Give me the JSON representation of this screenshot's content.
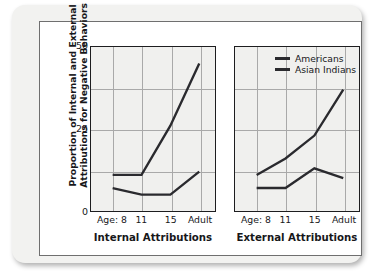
{
  "figure": {
    "y_axis_title": "Proportion of Internal and External\nAttributions for Negative Behaviors"
  },
  "chart_data": [
    {
      "type": "line",
      "title": "Internal Attributions",
      "xlabel": "",
      "ylabel": "Proportion of Internal and External Attributions for Negative Behaviors",
      "categories": [
        "Age: 8",
        "11",
        "15",
        "Adult"
      ],
      "ylim": [
        0,
        50
      ],
      "yticks": [
        0,
        25,
        50
      ],
      "ytick_labels": [
        "0",
        "25",
        "50"
      ],
      "grid": "both",
      "legend": "none",
      "series": [
        {
          "name": "Americans",
          "values": [
            11,
            11,
            26,
            45
          ]
        },
        {
          "name": "Asian Indians",
          "values": [
            7,
            5,
            5,
            12
          ]
        }
      ]
    },
    {
      "type": "line",
      "title": "External Attributions",
      "xlabel": "",
      "ylabel": "",
      "categories": [
        "Age: 8",
        "11",
        "15",
        "Adult"
      ],
      "ylim": [
        0,
        50
      ],
      "yticks": [
        0,
        25,
        50
      ],
      "ytick_labels": [],
      "grid": "both",
      "legend": "top-right-inside",
      "series": [
        {
          "name": "Americans",
          "values": [
            11,
            16,
            23,
            37
          ]
        },
        {
          "name": "Asian Indians",
          "values": [
            7,
            7,
            13,
            10
          ]
        }
      ]
    }
  ],
  "legend": {
    "entries": [
      {
        "label": "Americans",
        "color": "#2a2a2e"
      },
      {
        "label": "Asian Indians",
        "color": "#2a2a2e"
      }
    ]
  },
  "colors": {
    "series_line": "#2a2a2e",
    "plot_background": "#f0f0ee",
    "gridline": "#a9a9a9",
    "axis": "#1d1d1f",
    "text": "#17171a",
    "plate": "#f2f2f0"
  }
}
